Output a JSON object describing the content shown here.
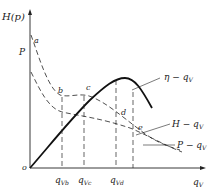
{
  "diagram": {
    "y_axis_label": "H(p)",
    "y_tick_label": "P",
    "x_axis_label": "q_V",
    "x_axis_label_main": "q",
    "x_axis_label_sub": "V",
    "origin_label": "o",
    "point_labels": [
      "a",
      "b",
      "c",
      "d",
      "e"
    ],
    "x_ticks": [
      {
        "main": "q",
        "sub": "Vb"
      },
      {
        "main": "q",
        "sub": "Vc"
      },
      {
        "main": "q",
        "sub": "Vd"
      }
    ],
    "curves": [
      {
        "name": "eta-curve",
        "label": "η − q_V",
        "label_main": "η − q",
        "label_sub": "V",
        "style": "solid-bold"
      },
      {
        "name": "head-curve",
        "label": "H − q_V",
        "label_main": "H − q",
        "label_sub": "V",
        "style": "dashed"
      },
      {
        "name": "power-curve",
        "label": "P − q_V",
        "label_main": "P − q",
        "label_sub": "V",
        "style": "dashed"
      }
    ],
    "colors": {
      "line": "#222222",
      "background": "#ffffff"
    }
  }
}
